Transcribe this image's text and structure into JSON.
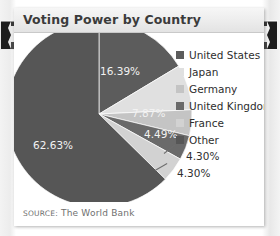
{
  "card": {
    "title": "Voting Power by Country",
    "source_prefix": "SOURCE:",
    "source_text": "The World Bank"
  },
  "legend": {
    "items": [
      {
        "label": "United States",
        "color": "#5c5c5c"
      },
      {
        "label": "Japan",
        "color": "#e0e0e0"
      },
      {
        "label": "Germany",
        "color": "#c4c4c4"
      },
      {
        "label": "United Kingdom",
        "color": "#6a6a6a"
      },
      {
        "label": "France",
        "color": "#d2d2d2"
      },
      {
        "label": "Other",
        "color": "#565656"
      }
    ]
  },
  "chart_data": {
    "type": "pie",
    "title": "Voting Power by Country",
    "categories": [
      "United States",
      "Japan",
      "Germany",
      "United Kingdom",
      "France",
      "Other"
    ],
    "values": [
      16.39,
      7.87,
      4.49,
      4.3,
      4.3,
      62.63
    ],
    "value_labels": [
      "16.39%",
      "7.87%",
      "4.49%",
      "4.30%",
      "4.30%",
      "62.63%"
    ],
    "colors": [
      "#5c5c5c",
      "#e0e0e0",
      "#c4c4c4",
      "#6a6a6a",
      "#d2d2d2",
      "#565656"
    ],
    "units": "percent",
    "start_angle_deg": 0,
    "direction": "clockwise",
    "legend_position": "right",
    "grid": false,
    "xlabel": "",
    "ylabel": ""
  },
  "slice_labels": [
    {
      "text": "16.39%",
      "x": 86,
      "y": 32,
      "style": "light"
    },
    {
      "text": "7.87%",
      "x": 118,
      "y": 74,
      "style": "light"
    },
    {
      "text": "4.49%",
      "x": 130,
      "y": 95,
      "style": "light"
    },
    {
      "text": "4.30%",
      "x": 172,
      "y": 117,
      "style": "dark"
    },
    {
      "text": "4.30%",
      "x": 163,
      "y": 134,
      "style": "dark"
    },
    {
      "text": "62.63%",
      "x": 19,
      "y": 106,
      "style": "light"
    }
  ]
}
